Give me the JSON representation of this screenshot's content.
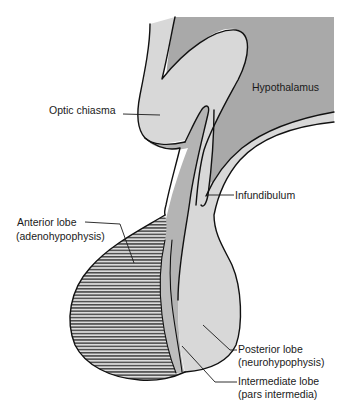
{
  "figure": {
    "colors": {
      "background": "#ffffff",
      "hypothalamus_fill": "#a9a9a9",
      "neural_tissue_fill": "#d8d8d8",
      "stalk_band_fill": "#b4b4b4",
      "anterior_hatch_line": "#4a4a4a",
      "anterior_hatch_bg": "#dcdcdc",
      "outline": "#111111",
      "label_text": "#1a1a1a"
    },
    "labels": {
      "hypothalamus": "Hypothalamus",
      "optic_chiasma": "Optic chiasma",
      "infundibulum": "Infundibulum",
      "anterior_lobe_line1": "Anterior lobe",
      "anterior_lobe_line2": "(adenohypophysis)",
      "posterior_lobe_line1": "Posterior lobe",
      "posterior_lobe_line2": "(neurohypophysis)",
      "intermediate_lobe_line1": "Intermediate lobe",
      "intermediate_lobe_line2": "(pars intermedia)"
    }
  }
}
